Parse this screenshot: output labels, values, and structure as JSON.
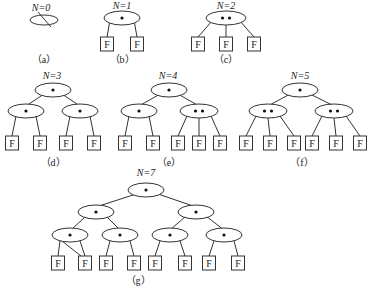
{
  "leaf_label": "F",
  "panels": [
    {
      "id": "a",
      "caption": "（a）",
      "title": "N=0"
    },
    {
      "id": "b",
      "caption": "（b）",
      "title": "N=1"
    },
    {
      "id": "c",
      "caption": "（c）",
      "title": "N=2"
    },
    {
      "id": "d",
      "caption": "（d）",
      "title": "N=3"
    },
    {
      "id": "e",
      "caption": "（e）",
      "title": "N=4"
    },
    {
      "id": "f",
      "caption": "（f）",
      "title": "N=5"
    },
    {
      "id": "g",
      "caption": "（g）",
      "title": "N=7"
    }
  ],
  "colors": {
    "stroke": "#333333",
    "background": "#ffffff"
  }
}
